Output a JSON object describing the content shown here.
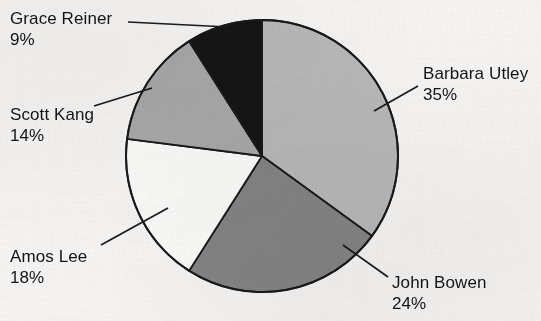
{
  "chart_data": {
    "type": "pie",
    "title": "",
    "xlabel": "",
    "ylabel": "",
    "legend_position": "callout-labels",
    "grid": false,
    "start_angle_deg": 0,
    "direction": "clockwise",
    "categories": [
      "Barbara Utley",
      "John Bowen",
      "Amos Lee",
      "Scott Kang",
      "Grace Reiner"
    ],
    "values": [
      35,
      24,
      18,
      14,
      9
    ],
    "unit": "%",
    "slices": [
      {
        "label": "Barbara Utley",
        "percent_label": "35%",
        "value": 35,
        "fill": "#b8b8b8",
        "stroke": "#1a1a1a"
      },
      {
        "label": "John Bowen",
        "percent_label": "24%",
        "value": 24,
        "fill": "#848484",
        "stroke": "#1a1a1a"
      },
      {
        "label": "Amos Lee",
        "percent_label": "18%",
        "value": 18,
        "fill": "#fbfbfa",
        "stroke": "#1a1a1a"
      },
      {
        "label": "Scott Kang",
        "percent_label": "14%",
        "value": 14,
        "fill": "#a8a8a8",
        "stroke": "#1a1a1a"
      },
      {
        "label": "Grace Reiner",
        "percent_label": "9%",
        "value": 9,
        "fill": "#151515",
        "stroke": "#1a1a1a"
      }
    ]
  },
  "colors": {
    "background": "#f6f5f3",
    "text": "#141414",
    "outline": "#1a1a1a",
    "leader_line": "#1a1a1a"
  }
}
